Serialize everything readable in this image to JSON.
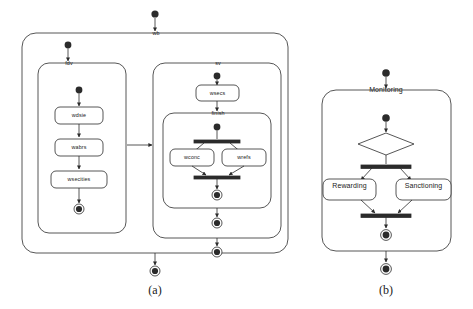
{
  "figure": {
    "type": "uml-activity-diagram",
    "background": "#ffffff",
    "line_color": "#2b2b2b",
    "node_fill": "#ffffff",
    "panels": [
      {
        "caption": "(a)"
      },
      {
        "caption": "(b)"
      }
    ]
  },
  "panel_a": {
    "caption": "(a)",
    "outer_region_label": "wb",
    "left_region_label": "fdv",
    "right_region_label": "sv",
    "nested_region_label": "finish",
    "left_activities": [
      "wdsie",
      "wabrs",
      "wsecities"
    ],
    "right_activity": "wsecs",
    "parallel_activities": [
      "wconc",
      "wrefs"
    ],
    "initial_nodes": 5,
    "final_nodes": 5,
    "fork_bars": 2
  },
  "panel_b": {
    "caption": "(b)",
    "region_label": "Monitoring",
    "activities": [
      "Rewarding",
      "Sanctioning"
    ],
    "decision_node": "diamond",
    "initial_nodes": 2,
    "final_nodes": 2,
    "fork_bars": 2
  },
  "colors": {
    "stroke": "#2b2b2b",
    "fill": "#ffffff",
    "text": "#222222",
    "caption": "#1a1a1a"
  }
}
